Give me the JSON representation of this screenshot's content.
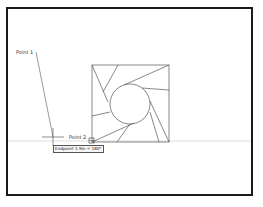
{
  "drawing": {
    "frame": {
      "x": 7,
      "y": 8,
      "width": 245,
      "height": 187,
      "color": "#1a1a1a"
    },
    "square": {
      "x": 92,
      "y": 65,
      "size": 77
    },
    "circle": {
      "cx": 130,
      "cy": 104,
      "r": 20
    },
    "baseline_y": 141
  },
  "labels": {
    "point1": "Point 1",
    "point2": "Point 2"
  },
  "tooltip": {
    "text": "Endpoint 1.9in < 180°"
  },
  "colors": {
    "line": "#555555",
    "frame": "#1a1a1a",
    "baseline": "#c8c8c8"
  }
}
